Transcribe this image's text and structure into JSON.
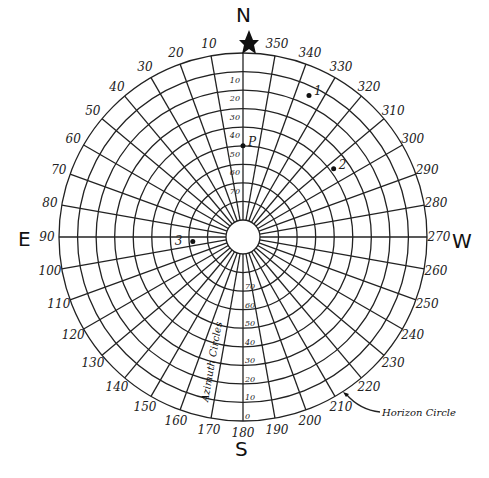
{
  "center": {
    "x": 243,
    "y": 237
  },
  "outer_radius": 184,
  "inner_radius": 17,
  "cardinals": {
    "north": "N",
    "south": "S",
    "east": "E",
    "west": "W"
  },
  "azimuth_step": 10,
  "azimuth_labels": [
    "10",
    "20",
    "30",
    "40",
    "50",
    "60",
    "70",
    "80",
    "90",
    "100",
    "110",
    "120",
    "130",
    "140",
    "150",
    "160",
    "170",
    "180",
    "190",
    "200",
    "210",
    "220",
    "230",
    "240",
    "250",
    "260",
    "270",
    "280",
    "290",
    "300",
    "310",
    "320",
    "330",
    "340",
    "350"
  ],
  "altitude_labels_north": [
    "10",
    "20",
    "30",
    "40",
    "50",
    "60",
    "70"
  ],
  "altitude_labels_south": [
    "0",
    "10",
    "20",
    "30",
    "40",
    "50",
    "60",
    "70"
  ],
  "points": [
    {
      "label": "1",
      "azimuth": 335,
      "altitude": 15
    },
    {
      "label": "P",
      "azimuth": 0,
      "altitude": 50
    },
    {
      "label": "2",
      "azimuth": 307,
      "altitude": 38
    },
    {
      "label": "3",
      "azimuth": 95,
      "altitude": 72
    }
  ],
  "annotations": {
    "azimuth_circles": "Azimuth Circles",
    "horizon_circle": "Horizon Circle"
  },
  "colors": {
    "ink": "#222222",
    "background": "#ffffff"
  }
}
